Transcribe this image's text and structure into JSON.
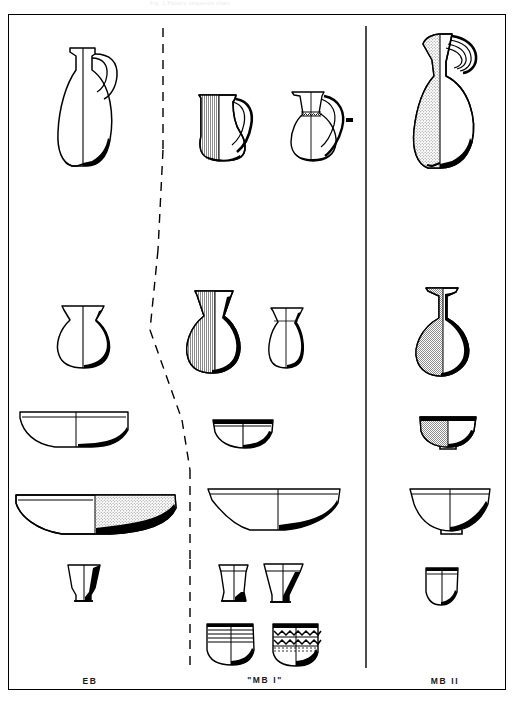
{
  "plate": {
    "faint_caption": "Fig. 1  Pottery sequence chart",
    "background": "#ffffff",
    "ink": "#000000",
    "hatch_fill": "#9a9a9a",
    "solid_fill": "#000000"
  },
  "columns": [
    {
      "id": "eb",
      "label": "EB",
      "divider_after": "dashed"
    },
    {
      "id": "mb1",
      "label": "\"MB I\"",
      "divider_after": "solid"
    },
    {
      "id": "mb2",
      "label": "MB II",
      "divider_after": "none"
    }
  ],
  "dividers": [
    {
      "name": "divider-eb-mb1",
      "style": "dashed",
      "x": 163,
      "y1": 25,
      "y2": 668
    },
    {
      "name": "divider-mb1-mb2",
      "style": "solid",
      "x": 365,
      "y1": 25,
      "y2": 668
    }
  ],
  "rows": [
    {
      "id": "row-jugs",
      "name": "jugs-with-handle"
    },
    {
      "id": "row-jars",
      "name": "small-jars-juglets"
    },
    {
      "id": "row-small-bowls",
      "name": "small-hemispherical-bowls"
    },
    {
      "id": "row-platters",
      "name": "large-platters-deep-bowls"
    },
    {
      "id": "row-cups",
      "name": "small-cups-goblets"
    },
    {
      "id": "row-decorated",
      "name": "decorated-jars"
    }
  ],
  "vessels": [
    {
      "id": "eb-jug",
      "column": "eb",
      "row": "row-jugs",
      "type": "handled jug / amphoriskos",
      "fill": "white"
    },
    {
      "id": "mb1-jug-a",
      "column": "mb1",
      "row": "row-jugs",
      "type": "handled jug",
      "fill": "hatched-left"
    },
    {
      "id": "mb1-jug-b",
      "column": "mb1",
      "row": "row-jugs",
      "type": "handled jug, banded neck",
      "fill": "white"
    },
    {
      "id": "mb1-jug-b-dot",
      "column": "mb1",
      "row": "row-jugs",
      "type": "profile tick mark",
      "fill": "solid"
    },
    {
      "id": "mb2-jug",
      "column": "mb2",
      "row": "row-jugs",
      "type": "trefoil jug, ridged handle",
      "fill": "hatched-left"
    },
    {
      "id": "eb-jar",
      "column": "eb",
      "row": "row-jars",
      "type": "globular jar",
      "fill": "white"
    },
    {
      "id": "mb1-jar-a",
      "column": "mb1",
      "row": "row-jars",
      "type": "flaring-neck jar",
      "fill": "hatched-left"
    },
    {
      "id": "mb1-jar-b",
      "column": "mb1",
      "row": "row-jars",
      "type": "small jar",
      "fill": "white"
    },
    {
      "id": "mb2-juglet",
      "column": "mb2",
      "row": "row-jars",
      "type": "piriform juglet",
      "fill": "hatched-left"
    },
    {
      "id": "eb-bowl-sm",
      "column": "eb",
      "row": "row-small-bowls",
      "type": "shallow bowl",
      "fill": "white"
    },
    {
      "id": "mb1-bowl-sm",
      "column": "mb1",
      "row": "row-small-bowls",
      "type": "carinated bowl",
      "fill": "white"
    },
    {
      "id": "mb2-bowl-sm",
      "column": "mb2",
      "row": "row-small-bowls",
      "type": "rounded bowl",
      "fill": "hatched-left"
    },
    {
      "id": "eb-platter",
      "column": "eb",
      "row": "row-platters",
      "type": "large platter",
      "fill": "hatched-right"
    },
    {
      "id": "mb1-platter",
      "column": "mb1",
      "row": "row-platters",
      "type": "deep carinated bowl",
      "fill": "white"
    },
    {
      "id": "mb2-platter",
      "column": "mb2",
      "row": "row-platters",
      "type": "large open bowl",
      "fill": "white"
    },
    {
      "id": "eb-cup",
      "column": "eb",
      "row": "row-cups",
      "type": "small footed cup",
      "fill": "white"
    },
    {
      "id": "mb1-cup-a",
      "column": "mb1",
      "row": "row-cups",
      "type": "straight-sided goblet",
      "fill": "white"
    },
    {
      "id": "mb1-cup-b",
      "column": "mb1",
      "row": "row-cups",
      "type": "flaring goblet",
      "fill": "white"
    },
    {
      "id": "mb2-cup",
      "column": "mb2",
      "row": "row-cups",
      "type": "small cup",
      "fill": "white"
    },
    {
      "id": "mb1-dec-a",
      "column": "mb1",
      "row": "row-decorated",
      "type": "jar with incised bands",
      "fill": "white"
    },
    {
      "id": "mb1-dec-b",
      "column": "mb1",
      "row": "row-decorated",
      "type": "jar with zigzag bands",
      "fill": "white"
    }
  ]
}
